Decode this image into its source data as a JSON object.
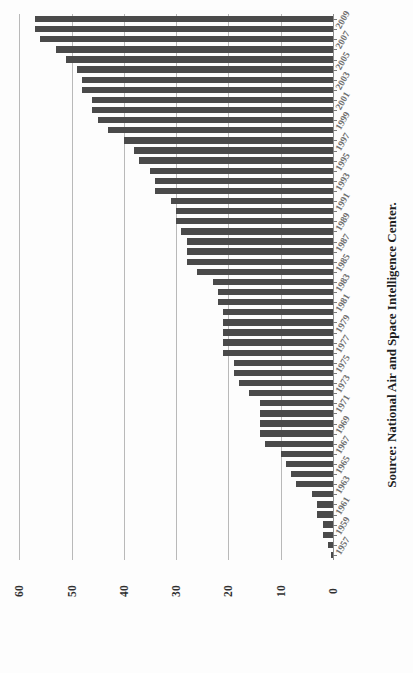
{
  "figure": {
    "orientation": "rotated-90",
    "source_note": "Source: National Air and Space Intelligence Center."
  },
  "axis": {
    "value_ticks": [
      "60",
      "50",
      "40",
      "30",
      "20",
      "10",
      "0"
    ],
    "category_ticks": [
      "2009",
      "2007",
      "2005",
      "2003",
      "2001",
      "1999",
      "1997",
      "1995",
      "1993",
      "1991",
      "1989",
      "1987",
      "1985",
      "1983",
      "1981",
      "1979",
      "1977",
      "1975",
      "1973",
      "1971",
      "1969",
      "1967",
      "1965",
      "1963",
      "1961",
      "1959",
      "1957"
    ]
  },
  "colors": {
    "bar": "#4a4a4a",
    "gridline": "#b9b9b9",
    "axis": "#8d8d8d",
    "tick_label": "#2f2f2f",
    "category_label": "#6f6f6f",
    "source_text": "#1f1f1f",
    "background": "#ffffff"
  },
  "chart_data": {
    "type": "bar",
    "title": "",
    "subtitle": "",
    "xlabel": "",
    "ylabel": "",
    "orientation": "horizontal",
    "grid": true,
    "legend": false,
    "xlim": [
      0,
      60
    ],
    "tick_step": 10,
    "label_every": 2,
    "annotations": [
      "Source: National Air and Space Intelligence Center."
    ],
    "categories": [
      "2010",
      "2009",
      "2008",
      "2007",
      "2006",
      "2005",
      "2004",
      "2003",
      "2002",
      "2001",
      "2000",
      "1999",
      "1998",
      "1997",
      "1996",
      "1995",
      "1994",
      "1993",
      "1992",
      "1991",
      "1990",
      "1989",
      "1988",
      "1987",
      "1986",
      "1985",
      "1984",
      "1983",
      "1982",
      "1981",
      "1980",
      "1979",
      "1978",
      "1977",
      "1976",
      "1975",
      "1974",
      "1973",
      "1972",
      "1971",
      "1970",
      "1969",
      "1968",
      "1967",
      "1966",
      "1965",
      "1964",
      "1963",
      "1962",
      "1961",
      "1960",
      "1959",
      "1958",
      "1957"
    ],
    "values": [
      57,
      57,
      56,
      53,
      51,
      49,
      48,
      48,
      46,
      46,
      45,
      43,
      40,
      38,
      37,
      35,
      34,
      34,
      31,
      30,
      30,
      29,
      28,
      28,
      28,
      26,
      23,
      22,
      22,
      21,
      21,
      21,
      21,
      21,
      19,
      19,
      18,
      16,
      14,
      14,
      14,
      14,
      13,
      10,
      9,
      8,
      7,
      4,
      3,
      3,
      2,
      2,
      1,
      0.4
    ]
  }
}
